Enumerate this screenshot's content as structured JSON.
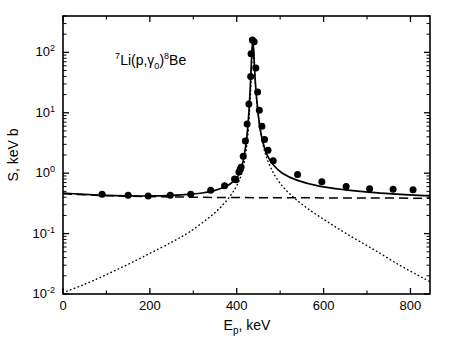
{
  "figure": {
    "reaction_label": "7Li(p,γ 0)8Be",
    "reaction_parts": {
      "sup_left": "7",
      "target": "Li(p,",
      "gamma": "γ",
      "gamma_sub": "0",
      "close": ")",
      "sup_right": "8",
      "residual": "Be"
    },
    "background": "#ffffff",
    "frame_color": "#000000",
    "marker_color": "#000000",
    "curve_color": "#000000"
  },
  "chart_data": {
    "type": "scatter",
    "title": "",
    "xlabel": "E_p, keV",
    "xlabel_parts": {
      "symbol": "E",
      "subscript": "p",
      "unit": ", keV"
    },
    "ylabel": "S, keV b",
    "xscale": "linear",
    "yscale": "log",
    "xlim": [
      0,
      845
    ],
    "ylim": [
      0.01,
      400
    ],
    "grid": false,
    "legend": "none",
    "xticks": [
      0,
      200,
      400,
      600,
      800
    ],
    "xticklabels": [
      "0",
      "200",
      "400",
      "600",
      "800"
    ],
    "xminorticks": [
      100,
      300,
      500,
      700
    ],
    "yticks": [
      0.01,
      0.1,
      1,
      10,
      100
    ],
    "yticklabels": [
      "10-2",
      "10-1",
      "100",
      "101",
      "102"
    ],
    "ytick_exponents": [
      "-2",
      "-1",
      "0",
      "1",
      "2"
    ],
    "ytick_mantissa": "10",
    "tick_direction": "in",
    "series": [
      {
        "name": "experimental data",
        "type": "scatter",
        "marker": "filled-circle",
        "marker_size": 7,
        "color": "#000000",
        "points": [
          [
            90,
            0.45
          ],
          [
            150,
            0.43
          ],
          [
            196,
            0.42
          ],
          [
            247,
            0.43
          ],
          [
            294,
            0.45
          ],
          [
            340,
            0.52
          ],
          [
            372,
            0.62
          ],
          [
            395,
            0.8
          ],
          [
            398,
            0.78
          ],
          [
            405,
            1.05
          ],
          [
            408,
            1.15
          ],
          [
            410,
            1.25
          ],
          [
            415,
            1.9
          ],
          [
            420,
            3.4
          ],
          [
            424,
            6.5
          ],
          [
            428,
            14
          ],
          [
            432,
            40
          ],
          [
            433,
            95
          ],
          [
            436,
            160
          ],
          [
            440,
            150
          ],
          [
            444,
            55
          ],
          [
            448,
            22
          ],
          [
            452,
            11
          ],
          [
            458,
            6.0
          ],
          [
            464,
            3.6
          ],
          [
            472,
            2.4
          ],
          [
            484,
            1.6
          ],
          [
            540,
            0.95
          ],
          [
            596,
            0.72
          ],
          [
            652,
            0.6
          ],
          [
            706,
            0.55
          ],
          [
            760,
            0.54
          ],
          [
            806,
            0.53
          ]
        ]
      },
      {
        "name": "total (direct + resonance)",
        "type": "line",
        "linestyle": "solid",
        "color": "#000000",
        "points": [
          [
            0,
            0.47
          ],
          [
            40,
            0.45
          ],
          [
            80,
            0.435
          ],
          [
            120,
            0.425
          ],
          [
            160,
            0.42
          ],
          [
            200,
            0.42
          ],
          [
            240,
            0.425
          ],
          [
            280,
            0.44
          ],
          [
            320,
            0.47
          ],
          [
            350,
            0.52
          ],
          [
            375,
            0.6
          ],
          [
            395,
            0.76
          ],
          [
            405,
            0.95
          ],
          [
            412,
            1.3
          ],
          [
            418,
            2.1
          ],
          [
            423,
            3.8
          ],
          [
            427,
            8.0
          ],
          [
            430,
            18
          ],
          [
            433,
            50
          ],
          [
            435,
            105
          ],
          [
            437,
            140
          ],
          [
            439,
            110
          ],
          [
            441,
            55
          ],
          [
            444,
            25
          ],
          [
            448,
            12
          ],
          [
            453,
            6.0
          ],
          [
            460,
            3.3
          ],
          [
            470,
            2.0
          ],
          [
            485,
            1.35
          ],
          [
            505,
            1.0
          ],
          [
            540,
            0.76
          ],
          [
            590,
            0.61
          ],
          [
            650,
            0.53
          ],
          [
            710,
            0.48
          ],
          [
            770,
            0.45
          ],
          [
            820,
            0.43
          ],
          [
            845,
            0.425
          ]
        ]
      },
      {
        "name": "direct capture",
        "type": "line",
        "linestyle": "dashed",
        "color": "#000000",
        "points": [
          [
            0,
            0.455
          ],
          [
            100,
            0.425
          ],
          [
            200,
            0.41
          ],
          [
            300,
            0.4
          ],
          [
            400,
            0.395
          ],
          [
            500,
            0.392
          ],
          [
            600,
            0.39
          ],
          [
            700,
            0.388
          ],
          [
            800,
            0.386
          ],
          [
            845,
            0.385
          ]
        ]
      },
      {
        "name": "resonance",
        "type": "line",
        "linestyle": "dotted",
        "color": "#000000",
        "points": [
          [
            0,
            0.0105
          ],
          [
            50,
            0.0145
          ],
          [
            100,
            0.021
          ],
          [
            150,
            0.031
          ],
          [
            200,
            0.047
          ],
          [
            250,
            0.072
          ],
          [
            290,
            0.105
          ],
          [
            330,
            0.17
          ],
          [
            360,
            0.26
          ],
          [
            385,
            0.42
          ],
          [
            400,
            0.62
          ],
          [
            410,
            0.92
          ],
          [
            418,
            1.6
          ],
          [
            424,
            3.2
          ],
          [
            428,
            7.0
          ],
          [
            431,
            16
          ],
          [
            434,
            50
          ],
          [
            436,
            110
          ],
          [
            438,
            120
          ],
          [
            440,
            70
          ],
          [
            443,
            28
          ],
          [
            447,
            13
          ],
          [
            452,
            6.5
          ],
          [
            458,
            3.6
          ],
          [
            466,
            2.1
          ],
          [
            478,
            1.25
          ],
          [
            495,
            0.76
          ],
          [
            520,
            0.47
          ],
          [
            560,
            0.27
          ],
          [
            610,
            0.155
          ],
          [
            665,
            0.088
          ],
          [
            720,
            0.052
          ],
          [
            775,
            0.03
          ],
          [
            820,
            0.02
          ],
          [
            845,
            0.016
          ]
        ]
      }
    ]
  },
  "annotations": [
    {
      "name": "reaction-annotation",
      "x_kev": 120,
      "y_value": 62
    }
  ]
}
